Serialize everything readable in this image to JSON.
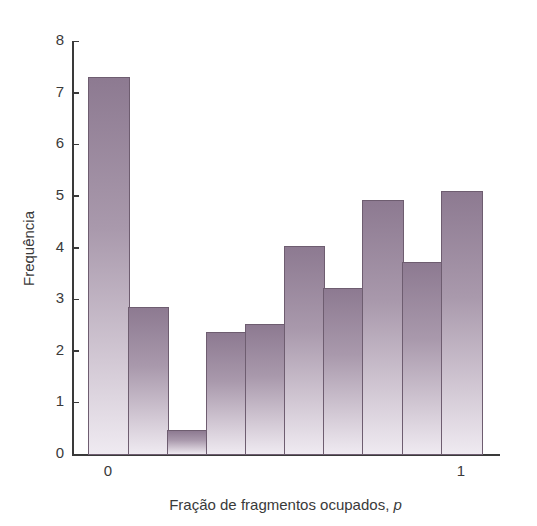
{
  "chart_data": {
    "type": "bar",
    "title": "",
    "xlabel": "Fração de fragmentos ocupados, p",
    "xlabel_text": "Fração de fragmentos ocupados, ",
    "xlabel_var": "p",
    "ylabel": "Frequência",
    "ylim": [
      0,
      8
    ],
    "yticks": [
      "0",
      "1",
      "2",
      "3",
      "4",
      "5",
      "6",
      "7",
      "8"
    ],
    "xtick_labels": [
      {
        "label": "0",
        "position": "first bar"
      },
      {
        "label": "1",
        "position": "last bar"
      }
    ],
    "categories": [
      "0.0-0.1",
      "0.1-0.2",
      "0.2-0.3",
      "0.3-0.4",
      "0.4-0.5",
      "0.5-0.6",
      "0.6-0.7",
      "0.7-0.8",
      "0.8-0.9",
      "0.9-1.0"
    ],
    "values": [
      7.3,
      2.85,
      0.47,
      2.36,
      2.52,
      4.03,
      3.22,
      4.92,
      3.72,
      5.1
    ],
    "grid": false,
    "legend": null,
    "bar_color_top": "#8d7a91",
    "bar_color_bottom": "#efeaf1",
    "bar_edge_color": "#6e5d70"
  }
}
